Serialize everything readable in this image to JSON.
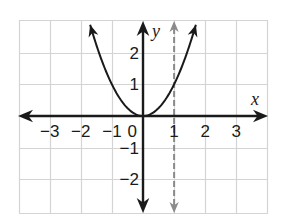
{
  "chart_data": {
    "type": "line",
    "title": "",
    "xlabel": "x",
    "ylabel": "y",
    "xlim": [
      -4,
      4
    ],
    "ylim": [
      -3.1,
      3.1
    ],
    "grid": true,
    "legend": null,
    "x_ticks": [
      -3,
      -2,
      -1,
      0,
      1,
      2,
      3
    ],
    "x_tick_labels": [
      "−3",
      "−2",
      "−1",
      "0",
      "1",
      "2",
      "3"
    ],
    "y_ticks": [
      -2,
      -1,
      1,
      2
    ],
    "y_tick_labels": [
      "−2",
      "−1",
      "1",
      "2"
    ],
    "series": [
      {
        "name": "y = x^2",
        "style": "solid",
        "color": "#1a1a1a",
        "x": [
          -1.7,
          -1.5,
          -1,
          -0.5,
          0,
          0.5,
          1,
          1.5,
          1.7
        ],
        "y": [
          2.89,
          2.25,
          1,
          0.25,
          0,
          0.25,
          1,
          2.25,
          2.89
        ],
        "arrows_at_ends": true
      },
      {
        "name": "axis of symmetry x = 1",
        "style": "dashed",
        "color": "#8a8a8a",
        "x": [
          1,
          1
        ],
        "y": [
          -3.1,
          3.1
        ],
        "arrows_at_ends": true
      }
    ],
    "annotations": []
  },
  "colors": {
    "grid": "#d4d4d4",
    "axis": "#1a1a1a",
    "curve": "#1a1a1a",
    "dashed": "#8a8a8a"
  }
}
